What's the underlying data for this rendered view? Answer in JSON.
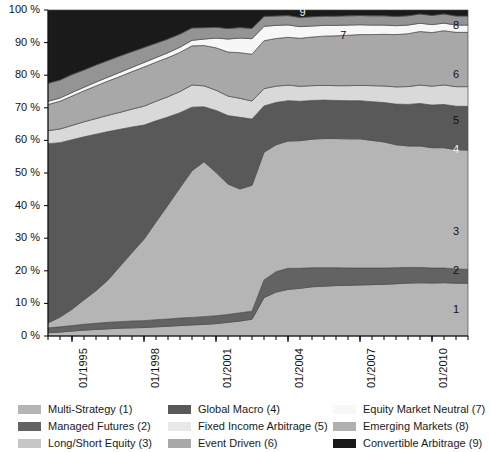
{
  "chart_data": {
    "type": "area",
    "stacked": "percent",
    "title": "",
    "xlabel": "",
    "ylabel": "",
    "ylim": [
      0,
      100
    ],
    "ytick_labels": [
      "0 %",
      "10 %",
      "20 %",
      "30 %",
      "40 %",
      "50 %",
      "60 %",
      "70 %",
      "80 %",
      "90 %",
      "100 %"
    ],
    "ytick_values": [
      0,
      10,
      20,
      30,
      40,
      50,
      60,
      70,
      80,
      90,
      100
    ],
    "xtick_labels": [
      "01/1995",
      "01/1998",
      "01/2001",
      "01/2004",
      "01/2007",
      "01/2010"
    ],
    "xtick_values": [
      1995.0,
      1998.0,
      2001.0,
      2004.0,
      2007.0,
      2010.0
    ],
    "xlim": [
      1994.0,
      2011.5
    ],
    "grid": false,
    "legend_position": "bottom",
    "x": [
      1994.0,
      1994.5,
      1995.0,
      1995.5,
      1996.0,
      1996.5,
      1997.0,
      1997.5,
      1998.0,
      1998.5,
      1999.0,
      1999.5,
      2000.0,
      2000.5,
      2001.0,
      2001.5,
      2002.0,
      2002.5,
      2003.0,
      2003.5,
      2004.0,
      2004.5,
      2005.0,
      2005.5,
      2006.0,
      2006.5,
      2007.0,
      2007.5,
      2008.0,
      2008.5,
      2009.0,
      2009.5,
      2010.0,
      2010.5,
      2011.0,
      2011.5
    ],
    "series": [
      {
        "name": "Multi-Strategy (1)",
        "index": 1,
        "color": "#b5b5b5",
        "values": [
          1.0,
          1.2,
          1.5,
          1.8,
          2.0,
          2.2,
          2.4,
          2.5,
          2.6,
          2.8,
          3.0,
          3.2,
          3.4,
          3.6,
          3.8,
          4.2,
          4.6,
          5.2,
          12.0,
          14.0,
          15.0,
          15.5,
          16.0,
          16.2,
          16.4,
          16.5,
          16.6,
          16.7,
          16.8,
          17.0,
          17.2,
          17.3,
          17.4,
          17.5,
          17.5,
          17.5
        ]
      },
      {
        "name": "Managed Futures (2)",
        "index": 2,
        "color": "#636363",
        "values": [
          1.5,
          1.6,
          1.7,
          1.8,
          1.9,
          2.0,
          2.0,
          2.1,
          2.1,
          2.2,
          2.2,
          2.3,
          2.3,
          2.4,
          2.4,
          2.4,
          2.5,
          2.5,
          5.5,
          6.5,
          6.8,
          6.5,
          6.2,
          6.0,
          5.8,
          5.6,
          5.5,
          5.4,
          5.3,
          5.2,
          5.1,
          5.0,
          4.9,
          4.8,
          4.7,
          4.6
        ]
      },
      {
        "name": "Long/Short Equity (3)",
        "index": 3,
        "color": "#b5b5b5",
        "values": [
          1.5,
          3.0,
          5.0,
          7.5,
          10.0,
          13.0,
          17.0,
          21.0,
          25.0,
          30.0,
          35.0,
          40.0,
          45.0,
          48.0,
          44.0,
          40.0,
          38.0,
          39.0,
          40.0,
          40.5,
          41.0,
          41.5,
          41.8,
          42.0,
          42.0,
          42.0,
          42.0,
          41.5,
          41.0,
          40.0,
          39.5,
          39.5,
          39.5,
          39.5,
          39.5,
          39.5
        ]
      },
      {
        "name": "Global Macro (4)",
        "index": 4,
        "color": "#595959",
        "values": [
          55.0,
          53.5,
          52.0,
          50.0,
          48.0,
          45.5,
          42.0,
          38.5,
          35.0,
          31.0,
          27.0,
          23.0,
          19.5,
          17.0,
          19.0,
          21.0,
          22.0,
          20.5,
          14.5,
          13.5,
          13.0,
          12.8,
          12.6,
          12.5,
          12.4,
          12.4,
          12.4,
          12.6,
          12.8,
          13.2,
          13.5,
          13.8,
          14.0,
          14.2,
          14.4,
          14.5
        ]
      },
      {
        "name": "Fixed Income Arbitrage (5)",
        "index": 5,
        "color": "#d9d9d9",
        "values": [
          4.0,
          4.2,
          4.4,
          4.6,
          4.8,
          5.0,
          5.2,
          5.5,
          5.8,
          6.0,
          6.2,
          6.5,
          6.8,
          6.5,
          6.2,
          6.0,
          5.8,
          5.6,
          5.4,
          5.2,
          5.0,
          4.9,
          4.8,
          4.8,
          4.8,
          4.9,
          5.0,
          5.2,
          5.4,
          5.6,
          5.8,
          6.0,
          6.2,
          6.4,
          6.5,
          6.5
        ]
      },
      {
        "name": "Event Driven (6)",
        "index": 6,
        "color": "#a8a8a8",
        "values": [
          8.0,
          8.5,
          9.0,
          9.5,
          10.0,
          10.5,
          11.0,
          11.5,
          12.0,
          12.0,
          12.0,
          12.0,
          12.0,
          12.5,
          13.0,
          13.5,
          14.0,
          14.5,
          15.0,
          15.2,
          15.4,
          15.6,
          15.8,
          16.0,
          16.2,
          16.4,
          16.5,
          16.6,
          16.8,
          17.0,
          17.2,
          17.4,
          17.6,
          17.8,
          18.0,
          18.0
        ]
      },
      {
        "name": "Equity Market Neutral (7)",
        "index": 7,
        "color": "#f7f7f7",
        "values": [
          1.0,
          1.0,
          1.1,
          1.1,
          1.2,
          1.2,
          1.3,
          1.3,
          1.4,
          1.4,
          1.5,
          1.6,
          1.7,
          2.0,
          3.0,
          4.0,
          4.5,
          4.8,
          4.5,
          4.2,
          4.0,
          3.8,
          3.6,
          3.5,
          3.4,
          3.3,
          3.2,
          3.1,
          3.0,
          2.9,
          2.8,
          2.7,
          2.6,
          2.5,
          2.4,
          2.4
        ]
      },
      {
        "name": "Emerging Markets (8)",
        "index": 8,
        "color": "#949494",
        "values": [
          5.5,
          5.5,
          5.5,
          5.3,
          5.2,
          5.1,
          5.0,
          4.8,
          4.6,
          4.4,
          4.2,
          4.0,
          3.8,
          3.5,
          3.3,
          3.2,
          3.2,
          3.2,
          3.1,
          3.0,
          3.0,
          3.0,
          3.0,
          3.0,
          3.0,
          3.0,
          3.0,
          3.0,
          3.0,
          3.0,
          3.0,
          3.0,
          3.0,
          3.0,
          3.0,
          3.0
        ]
      },
      {
        "name": "Convertible Arbitrage (9)",
        "index": 9,
        "color": "#1a1a1a",
        "values": [
          22.5,
          21.5,
          19.8,
          18.4,
          16.9,
          15.5,
          14.1,
          12.8,
          11.5,
          10.2,
          8.9,
          7.4,
          5.5,
          5.5,
          5.3,
          5.7,
          5.4,
          5.7,
          2.0,
          1.9,
          1.8,
          2.4,
          2.2,
          2.0,
          2.0,
          1.9,
          1.8,
          1.9,
          1.9,
          2.1,
          1.9,
          1.3,
          1.8,
          1.3,
          2.0,
          2.0
        ]
      }
    ],
    "callouts": [
      {
        "label": "1",
        "x": 2011.0,
        "y": 8,
        "tone": "dark"
      },
      {
        "label": "2",
        "x": 2011.0,
        "y": 20,
        "tone": "dark"
      },
      {
        "label": "3",
        "x": 2011.0,
        "y": 32,
        "tone": "dark"
      },
      {
        "label": "4",
        "x": 2011.0,
        "y": 57,
        "tone": "light"
      },
      {
        "label": "5",
        "x": 2011.0,
        "y": 66,
        "tone": "dark"
      },
      {
        "label": "6",
        "x": 2011.0,
        "y": 80,
        "tone": "dark"
      },
      {
        "label": "7",
        "x": 2006.3,
        "y": 92,
        "tone": "dark"
      },
      {
        "label": "8",
        "x": 2011.0,
        "y": 95,
        "tone": "dark"
      },
      {
        "label": "9",
        "x": 2004.6,
        "y": 99,
        "tone": "light"
      }
    ]
  },
  "legend": {
    "columns": [
      {
        "items": [
          {
            "label": "Multi-Strategy (1)",
            "color": "#b5b5b5",
            "swatch": "swatch-multi-strategy"
          },
          {
            "label": "Managed Futures (2)",
            "color": "#636363",
            "swatch": "swatch-managed-futures"
          },
          {
            "label": "Long/Short Equity (3)",
            "color": "#c6c6c6",
            "swatch": "swatch-long-short-equity"
          }
        ]
      },
      {
        "items": [
          {
            "label": "Global Macro (4)",
            "color": "#595959",
            "swatch": "swatch-global-macro"
          },
          {
            "label": "Fixed Income Arbitrage (5)",
            "color": "#e8e8e8",
            "swatch": "swatch-fixed-income-arbitrage"
          },
          {
            "label": "Event Driven (6)",
            "color": "#a8a8a8",
            "swatch": "swatch-event-driven"
          }
        ]
      },
      {
        "items": [
          {
            "label": "Equity Market Neutral (7)",
            "color": "#f7f7f7",
            "swatch": "swatch-equity-market-neutral"
          },
          {
            "label": "Emerging Markets (8)",
            "color": "#b0b0b0",
            "swatch": "swatch-emerging-markets"
          },
          {
            "label": "Convertible Arbitrage (9)",
            "color": "#1a1a1a",
            "swatch": "swatch-convertible-arbitrage"
          }
        ]
      }
    ]
  },
  "axis_style": {
    "axis_color": "#000000",
    "band_edge_color": "#4d4d4d"
  }
}
